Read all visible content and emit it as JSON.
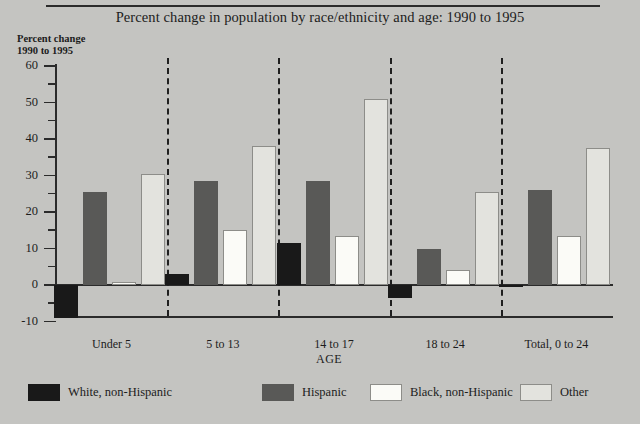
{
  "figure": {
    "title": "Percent change in population by race/ethnicity and age: 1990 to 1995",
    "y_caption_line1": "Percent change",
    "y_caption_line2": "1990 to 1995",
    "axis_title": "AGE"
  },
  "chart_data": {
    "type": "bar",
    "title": "Percent change in population by race/ethnicity and age: 1990 to 1995",
    "xlabel": "AGE",
    "ylabel": "Percent change 1990 to 1995",
    "ylim": [
      -10,
      60
    ],
    "ytick_major": [
      -10,
      0,
      10,
      20,
      30,
      40,
      50,
      60
    ],
    "ytick_minor": [
      -5,
      5,
      15,
      25,
      35,
      45,
      55
    ],
    "grid": false,
    "legend_position": "bottom",
    "group_separators": true,
    "categories": [
      "Under 5",
      "5 to 13",
      "14 to 17",
      "18 to 24",
      "Total, 0 to 24"
    ],
    "series": [
      {
        "name": "White, non-Hispanic",
        "color": "#191919",
        "values": [
          -9.0,
          3.0,
          11.5,
          -3.5,
          -0.5
        ]
      },
      {
        "name": "Hispanic",
        "color": "#595957",
        "values": [
          25.5,
          28.5,
          28.5,
          10.0,
          26.0
        ]
      },
      {
        "name": "Black, non-Hispanic",
        "color": "#fbfbf7",
        "values": [
          0.7,
          15.0,
          13.5,
          4.0,
          13.5
        ]
      },
      {
        "name": "Other",
        "color": "#e3e3de",
        "values": [
          30.5,
          38.0,
          51.0,
          25.5,
          37.5
        ]
      }
    ]
  },
  "legend": [
    {
      "label": "White, non-Hispanic",
      "swatch": "s0"
    },
    {
      "label": "Hispanic",
      "swatch": "s1"
    },
    {
      "label": "Black, non-Hispanic",
      "swatch": "s2"
    },
    {
      "label": "Other",
      "swatch": "s3"
    }
  ]
}
